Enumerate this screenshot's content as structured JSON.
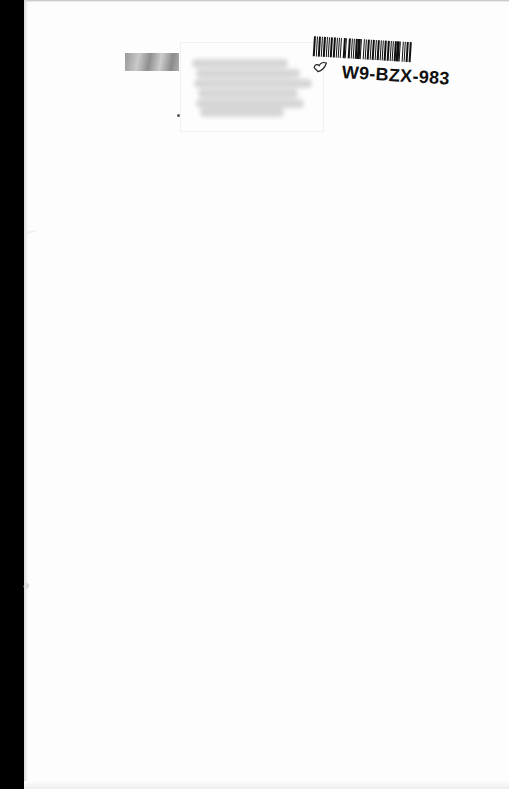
{
  "document": {
    "type": "scanned-book-page",
    "page_color": "#fdfdfd",
    "background_color": "#000000"
  },
  "library_label": {
    "barcode_id": "W9-BZX-983",
    "barcode_pattern": [
      3,
      1,
      1,
      2,
      2,
      1,
      1,
      2,
      3,
      1,
      2,
      1,
      1,
      2,
      2,
      1,
      3,
      1,
      1,
      2,
      2,
      1,
      1,
      3,
      2,
      1,
      1,
      2,
      3,
      1,
      2,
      1,
      1,
      2,
      2,
      1,
      3,
      1,
      1,
      2,
      2,
      1,
      2,
      1,
      3,
      1,
      1,
      2,
      2,
      1,
      1,
      2,
      3,
      1,
      2,
      1,
      1,
      2,
      2,
      1,
      3,
      1,
      1,
      2,
      2,
      1,
      2,
      1,
      3,
      1,
      1,
      2,
      2,
      1,
      1,
      2,
      3,
      1,
      2,
      1
    ],
    "doodle_icon": "hand-drawn-leaf-icon"
  },
  "bookplate": {
    "photo_thumbnail": "faded-sticker-photo",
    "redacted_text_lines": 6
  }
}
